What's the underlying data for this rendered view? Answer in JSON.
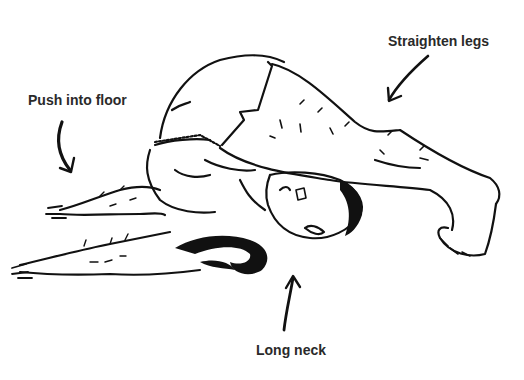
{
  "figure": {
    "annotations": [
      {
        "id": "push",
        "text": "Push into floor",
        "arrow": "curved-down"
      },
      {
        "id": "legs",
        "text": "Straighten legs",
        "arrow": "down-left"
      },
      {
        "id": "neck",
        "text": "Long neck",
        "arrow": "up"
      }
    ]
  },
  "colors": {
    "ink": "#111111",
    "text": "#2a2a2a",
    "background": "#ffffff"
  }
}
